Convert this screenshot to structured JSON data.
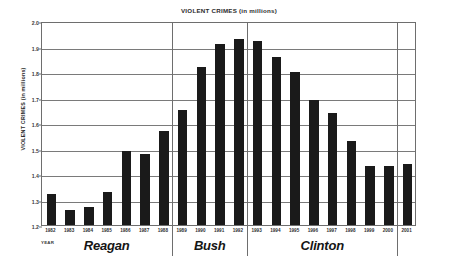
{
  "chart_data": {
    "type": "bar",
    "title": "VIOLENT CRIMES (in millions)",
    "xlabel": "YEAR",
    "ylabel": "VIOLENT CRIMES (in millions)",
    "ylim": [
      1.2,
      2.0
    ],
    "ytick_step": 0.1,
    "ytick_labels": [
      "2.0",
      "1.9",
      "1.8",
      "1.7",
      "1.6",
      "1.5",
      "1.4",
      "1.3",
      "1.2"
    ],
    "ytick_values": [
      2.0,
      1.9,
      1.8,
      1.7,
      1.6,
      1.5,
      1.4,
      1.3,
      1.2
    ],
    "grid": true,
    "legend": "none",
    "bar_color": "#1a1a1a",
    "categories": [
      "1982",
      "1983",
      "1984",
      "1985",
      "1986",
      "1987",
      "1988",
      "1989",
      "1990",
      "1991",
      "1992",
      "1993",
      "1994",
      "1995",
      "1996",
      "1997",
      "1998",
      "1999",
      "2000",
      "2001"
    ],
    "values": [
      1.32,
      1.26,
      1.27,
      1.33,
      1.49,
      1.48,
      1.57,
      1.65,
      1.82,
      1.91,
      1.93,
      1.92,
      1.86,
      1.8,
      1.69,
      1.64,
      1.53,
      1.43,
      1.43,
      1.44
    ],
    "annotations": [
      {
        "label": "Reagan",
        "from": "1982",
        "to": "1988"
      },
      {
        "label": "Bush",
        "from": "1989",
        "to": "1992"
      },
      {
        "label": "Clinton",
        "from": "1993",
        "to": "2000"
      }
    ],
    "era_separator_after": [
      "1988",
      "1992",
      "2000"
    ]
  },
  "axis": {
    "year_caption": "YEAR"
  }
}
